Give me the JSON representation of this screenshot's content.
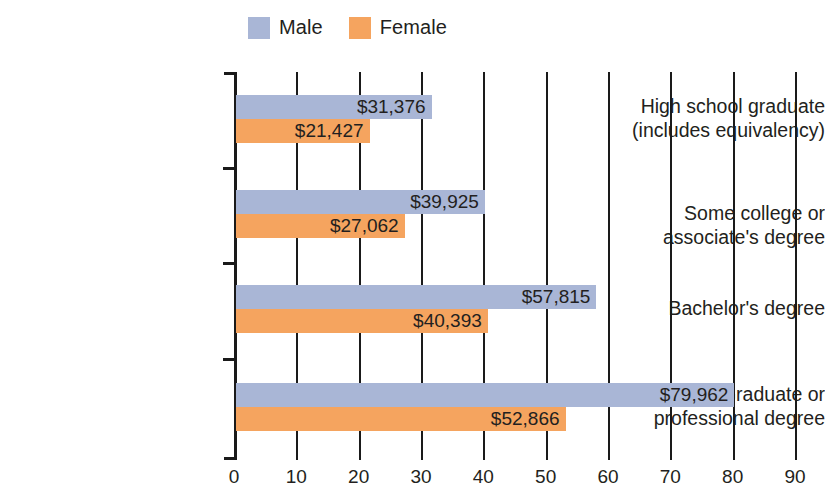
{
  "legend": {
    "position": "top-center",
    "entries": [
      {
        "label": "Male",
        "color": "#a9b6d6",
        "swatch_name": "legend-swatch-male"
      },
      {
        "label": "Female",
        "color": "#f5a45f",
        "swatch_name": "legend-swatch-female"
      }
    ]
  },
  "chart_data": {
    "type": "bar",
    "orientation": "horizontal",
    "title": "",
    "subtitle": "",
    "xlabel": "",
    "ylabel": "",
    "xlim": [
      0,
      90
    ],
    "xticks": [
      0,
      10,
      20,
      30,
      40,
      50,
      60,
      70,
      80,
      90
    ],
    "xtick_labels": [
      "0",
      "10",
      "20",
      "30",
      "40",
      "50",
      "60",
      "70",
      "80",
      "90"
    ],
    "grid": true,
    "grid_axis": "x",
    "legend_position": "top-center",
    "value_unit": "thousands of dollars",
    "categories": [
      "High school graduate\n(includes equivalency)",
      "Some college or\nassociate's degree",
      "Bachelor's degree",
      "Graduate or\nprofessional degree"
    ],
    "category_lines": [
      [
        "High school graduate",
        "(includes equivalency)"
      ],
      [
        "Some college or",
        "associate's degree"
      ],
      [
        "Bachelor's degree"
      ],
      [
        "Graduate or",
        "professional degree"
      ]
    ],
    "series": [
      {
        "name": "Male",
        "color": "#a9b6d6",
        "values": [
          31.376,
          39.925,
          57.815,
          79.962
        ],
        "labels": [
          "$31,376",
          "$39,925",
          "$57,815",
          "$79,962"
        ]
      },
      {
        "name": "Female",
        "color": "#f5a45f",
        "values": [
          21.427,
          27.062,
          40.393,
          52.866
        ],
        "labels": [
          "$21,427",
          "$27,062",
          "$40,393",
          "$52,866"
        ]
      }
    ]
  },
  "axis": {
    "line_color": "#1a1a1a"
  }
}
